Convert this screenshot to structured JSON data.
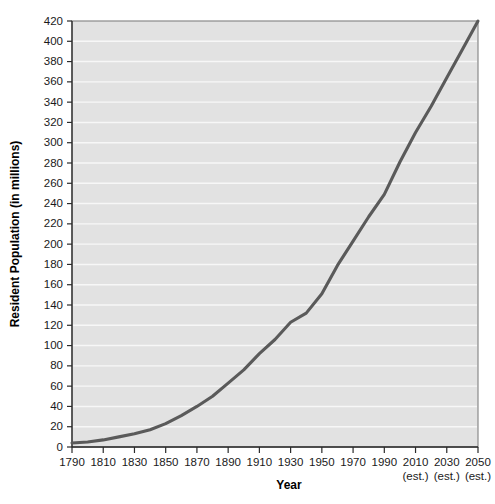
{
  "chart_data": {
    "type": "line",
    "title": "",
    "xlabel": "Year",
    "ylabel": "Resident Population (in millions)",
    "xlim": [
      1790,
      2050
    ],
    "ylim": [
      0,
      420
    ],
    "grid": "horizontal",
    "legend": "none",
    "line_color": "#5a5a5a",
    "plot_background": "#e2e2e2",
    "gridline_color": "#f7f7f7",
    "x_tick_labels": [
      "1790",
      "1810",
      "1830",
      "1850",
      "1870",
      "1890",
      "1910",
      "1930",
      "1950",
      "1970",
      "1990",
      "2010",
      "2030",
      "2050"
    ],
    "x_tick_sublabels": [
      "",
      "",
      "",
      "",
      "",
      "",
      "",
      "",
      "",
      "",
      "",
      "(est.)",
      "(est.)",
      "(est.)"
    ],
    "y_tick_labels": [
      "0",
      "20",
      "40",
      "60",
      "80",
      "100",
      "120",
      "140",
      "160",
      "180",
      "200",
      "220",
      "240",
      "260",
      "280",
      "300",
      "320",
      "340",
      "360",
      "380",
      "400",
      "420"
    ],
    "x": [
      1790,
      1800,
      1810,
      1820,
      1830,
      1840,
      1850,
      1860,
      1870,
      1880,
      1890,
      1900,
      1910,
      1920,
      1930,
      1940,
      1950,
      1960,
      1970,
      1980,
      1990,
      2000,
      2010,
      2020,
      2030,
      2040,
      2050
    ],
    "values": [
      4,
      5,
      7,
      10,
      13,
      17,
      23,
      31,
      40,
      50,
      63,
      76,
      92,
      106,
      123,
      132,
      151,
      179,
      203,
      227,
      249,
      281,
      310,
      336,
      364,
      392,
      420
    ],
    "series": [
      {
        "name": "Resident Population",
        "values": [
          4,
          5,
          7,
          10,
          13,
          17,
          23,
          31,
          40,
          50,
          63,
          76,
          92,
          106,
          123,
          132,
          151,
          179,
          203,
          227,
          249,
          281,
          310,
          336,
          364,
          392,
          420
        ]
      }
    ],
    "annotations": [
      "2010, 2030 and 2050 values are estimates"
    ]
  }
}
